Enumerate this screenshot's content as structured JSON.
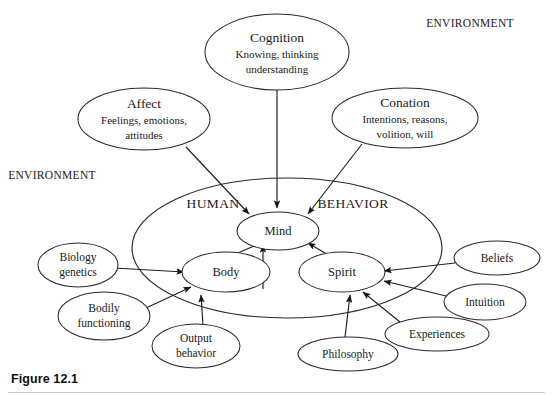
{
  "figure": {
    "caption": "Figure 12.1",
    "environment_labels": [
      {
        "id": "env-top-right",
        "text": "ENVIRONMENT",
        "x": 470,
        "y": 24
      },
      {
        "id": "env-left",
        "text": "ENVIRONMENT",
        "x": 52,
        "y": 176
      }
    ],
    "region_labels": [
      {
        "id": "region-human",
        "text": "HUMAN",
        "x": 213,
        "y": 205
      },
      {
        "id": "region-behavior",
        "text": "BEHAVIOR",
        "x": 353,
        "y": 205
      }
    ],
    "container": {
      "id": "human-behavior-ellipse",
      "cx": 287,
      "cy": 248,
      "rx": 155,
      "ry": 70
    },
    "nodes": [
      {
        "id": "cognition",
        "title": "Cognition",
        "lines": [
          "Knowing, thinking",
          "understanding"
        ],
        "cx": 277,
        "cy": 52,
        "rx": 72,
        "ry": 38
      },
      {
        "id": "affect",
        "title": "Affect",
        "lines": [
          "Feelings, emotions,",
          "attitudes"
        ],
        "cx": 144,
        "cy": 119,
        "rx": 66,
        "ry": 31
      },
      {
        "id": "conation",
        "title": "Conation",
        "lines": [
          "Intentions, reasons,",
          "volition, will"
        ],
        "cx": 405,
        "cy": 118,
        "rx": 73,
        "ry": 30
      },
      {
        "id": "mind",
        "title": "Mind",
        "lines": [],
        "cx": 278,
        "cy": 231,
        "rx": 41,
        "ry": 19
      },
      {
        "id": "body",
        "title": "Body",
        "lines": [],
        "cx": 226,
        "cy": 272,
        "rx": 44,
        "ry": 20
      },
      {
        "id": "spirit",
        "title": "Spirit",
        "lines": [],
        "cx": 342,
        "cy": 272,
        "rx": 43,
        "ry": 20
      },
      {
        "id": "biology-genetics",
        "title": "",
        "lines": [
          "Biology",
          "genetics"
        ],
        "cx": 78,
        "cy": 265,
        "rx": 40,
        "ry": 22
      },
      {
        "id": "bodily-functioning",
        "title": "",
        "lines": [
          "Bodily",
          "functioning"
        ],
        "cx": 104,
        "cy": 316,
        "rx": 46,
        "ry": 24
      },
      {
        "id": "output-behavior",
        "title": "",
        "lines": [
          "Output",
          "behavior"
        ],
        "cx": 196,
        "cy": 346,
        "rx": 44,
        "ry": 22
      },
      {
        "id": "beliefs",
        "title": "Beliefs",
        "lines": [],
        "cx": 497,
        "cy": 258,
        "rx": 43,
        "ry": 17
      },
      {
        "id": "intuition",
        "title": "Intuition",
        "lines": [],
        "cx": 485,
        "cy": 302,
        "rx": 41,
        "ry": 18
      },
      {
        "id": "experiences",
        "title": "Experiences",
        "lines": [],
        "cx": 437,
        "cy": 334,
        "rx": 52,
        "ry": 17
      },
      {
        "id": "philosophy",
        "title": "Philosophy",
        "lines": [],
        "cx": 348,
        "cy": 354,
        "rx": 50,
        "ry": 17
      }
    ],
    "edges": [
      {
        "id": "cognition-to-mind",
        "from": "cognition",
        "to": "mind",
        "arrow": true
      },
      {
        "id": "affect-to-mind",
        "from": "affect",
        "to": "mind",
        "arrow": true
      },
      {
        "id": "conation-to-mind",
        "from": "conation",
        "to": "mind",
        "arrow": true
      },
      {
        "id": "mind-to-body",
        "from": "mind",
        "to": "body",
        "arrow": true
      },
      {
        "id": "body-to-mind",
        "from": "body",
        "to": "mind",
        "arrow": true
      },
      {
        "id": "spirit-to-mind",
        "from": "spirit",
        "to": "mind",
        "arrow": true
      },
      {
        "id": "biology-genetics-to-body",
        "from": "biology-genetics",
        "to": "body",
        "arrow": true
      },
      {
        "id": "bodily-functioning-to-body",
        "from": "bodily-functioning",
        "to": "body",
        "arrow": true
      },
      {
        "id": "output-behavior-to-body",
        "from": "output-behavior",
        "to": "body",
        "arrow": true
      },
      {
        "id": "beliefs-to-spirit",
        "from": "beliefs",
        "to": "spirit",
        "arrow": true
      },
      {
        "id": "intuition-to-spirit",
        "from": "intuition",
        "to": "spirit",
        "arrow": true
      },
      {
        "id": "experiences-to-spirit",
        "from": "experiences",
        "to": "spirit",
        "arrow": true
      },
      {
        "id": "philosophy-to-spirit",
        "from": "philosophy",
        "to": "spirit",
        "arrow": true
      }
    ]
  }
}
